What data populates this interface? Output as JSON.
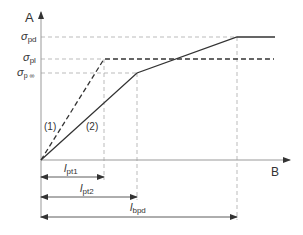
{
  "axes": {
    "y_label": "A",
    "x_label": "B"
  },
  "y_levels": [
    {
      "id": "pd",
      "symbol": "σ",
      "sub": "pd"
    },
    {
      "id": "pl",
      "symbol": "σ",
      "sub": "pl"
    },
    {
      "id": "pinf",
      "symbol": "σ",
      "sub": "p ∞"
    }
  ],
  "curves": [
    {
      "id": "1",
      "label": "(1)",
      "style": "dashed"
    },
    {
      "id": "2",
      "label": "(2)",
      "style": "solid"
    }
  ],
  "lengths": [
    {
      "id": "lpt1",
      "symbol": "l",
      "sub": "pt1"
    },
    {
      "id": "lpt2",
      "symbol": "l",
      "sub": "pt2"
    },
    {
      "id": "lbpd",
      "symbol": "l",
      "sub": "bpd"
    }
  ],
  "colors": {
    "line": "#333333",
    "guide": "#aaaaaa",
    "axis": "#999999"
  }
}
